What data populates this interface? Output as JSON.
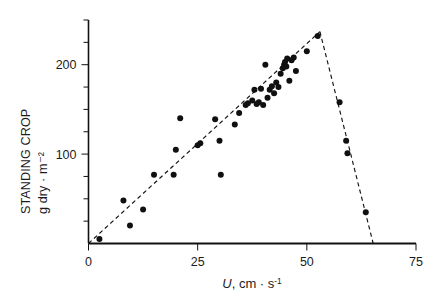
{
  "chart_data": {
    "type": "scatter",
    "title": "",
    "xlabel": "U, cm · s⁻¹",
    "ylabel_line1": "STANDING CROP",
    "ylabel_line2": "g dry · m⁻²",
    "xlim": [
      0,
      75
    ],
    "ylim": [
      0,
      250
    ],
    "xticks": [
      0,
      25,
      50,
      75
    ],
    "xtick_labels": [
      "0",
      "25",
      "50",
      "75"
    ],
    "yticks": [
      0,
      25,
      50,
      75,
      100,
      125,
      150,
      175,
      200,
      225,
      250
    ],
    "ytick_labels": [
      "",
      "",
      "",
      "",
      "100",
      "",
      "",
      "",
      "200",
      "",
      ""
    ],
    "ytick_labeled": [
      100,
      200
    ],
    "grid": false,
    "legend": false,
    "marker": "filled-circle",
    "marker_color": "#101010",
    "marker_size_px": 3.0,
    "points": [
      [
        2.5,
        5
      ],
      [
        8.0,
        48
      ],
      [
        9.5,
        20
      ],
      [
        12.5,
        38
      ],
      [
        15.0,
        77
      ],
      [
        19.5,
        77
      ],
      [
        20.0,
        105
      ],
      [
        21.0,
        140
      ],
      [
        25.0,
        110
      ],
      [
        25.6,
        112
      ],
      [
        29.0,
        139
      ],
      [
        30.0,
        115
      ],
      [
        30.3,
        77
      ],
      [
        33.5,
        133
      ],
      [
        34.5,
        146
      ],
      [
        36.0,
        155
      ],
      [
        36.5,
        157
      ],
      [
        37.5,
        160
      ],
      [
        38.0,
        172
      ],
      [
        38.5,
        156
      ],
      [
        39.0,
        158
      ],
      [
        39.5,
        173
      ],
      [
        40.0,
        155
      ],
      [
        40.5,
        200
      ],
      [
        41.0,
        163
      ],
      [
        41.5,
        172
      ],
      [
        42.0,
        176
      ],
      [
        42.5,
        168
      ],
      [
        43.0,
        180
      ],
      [
        43.5,
        175
      ],
      [
        44.0,
        190
      ],
      [
        44.5,
        196
      ],
      [
        44.8,
        200
      ],
      [
        45.0,
        203
      ],
      [
        45.3,
        198
      ],
      [
        45.5,
        207
      ],
      [
        46.0,
        182
      ],
      [
        46.5,
        205
      ],
      [
        47.0,
        208
      ],
      [
        47.5,
        193
      ],
      [
        50.0,
        215
      ],
      [
        52.5,
        232
      ],
      [
        57.5,
        158
      ],
      [
        59.0,
        115
      ],
      [
        59.3,
        101
      ],
      [
        63.5,
        35
      ]
    ],
    "fit_lines": [
      {
        "name": "ascending-limb",
        "style": "dashed",
        "points": [
          [
            0,
            0
          ],
          [
            53,
            237
          ]
        ]
      },
      {
        "name": "descending-limb",
        "style": "dashed",
        "points": [
          [
            53,
            237
          ],
          [
            65.2,
            0
          ]
        ]
      }
    ]
  }
}
